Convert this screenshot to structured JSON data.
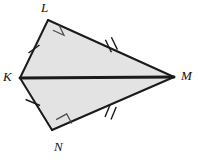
{
  "figure": {
    "name": "kite-KLMN",
    "canvas": {
      "width": 198,
      "height": 163
    },
    "fill_color": "#e3e3e3",
    "stroke_color": "#1a1a1a",
    "background_color": "#ffffff",
    "vertices": [
      {
        "id": "K",
        "label": "K",
        "x": 20,
        "y": 78
      },
      {
        "id": "L",
        "label": "L",
        "x": 48,
        "y": 20
      },
      {
        "id": "M",
        "label": "M",
        "x": 174,
        "y": 77
      },
      {
        "id": "N",
        "label": "N",
        "x": 52,
        "y": 130
      }
    ],
    "edges": [
      {
        "id": "KL",
        "from": "K",
        "to": "L",
        "ticks": 1,
        "stroke_width": 2
      },
      {
        "id": "LM",
        "from": "L",
        "to": "M",
        "ticks": 2,
        "stroke_width": 2
      },
      {
        "id": "MN",
        "from": "M",
        "to": "N",
        "ticks": 2,
        "stroke_width": 2
      },
      {
        "id": "NK",
        "from": "N",
        "to": "K",
        "ticks": 1,
        "stroke_width": 2
      }
    ],
    "diagonal": {
      "id": "KM",
      "from": "K",
      "to": "M",
      "stroke_width": 3
    },
    "right_angles": [
      {
        "at": "L",
        "label": "right-angle-marker-L"
      },
      {
        "at": "N",
        "label": "right-angle-marker-N"
      }
    ],
    "polygon_points": "20,78 48,20 174,77 52,130"
  }
}
